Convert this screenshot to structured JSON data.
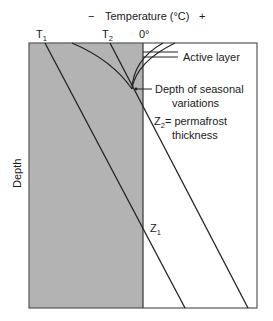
{
  "axis": {
    "title": "Temperature (°C)",
    "minus_sign": "−",
    "plus_sign": "+",
    "ylabel": "Depth"
  },
  "ticks": {
    "t1": {
      "main": "T",
      "sub": "1"
    },
    "t2": {
      "main": "T",
      "sub": "2"
    },
    "zero": "0°"
  },
  "annotations": {
    "active_layer": "Active layer",
    "seasonal_line1": "Depth of seasonal",
    "seasonal_line2": "variations",
    "z2_main": "Z",
    "z2_sub": "2",
    "z2_text": "= permafrost",
    "z2_text2": "thickness",
    "z1_main": "Z",
    "z1_sub": "1"
  },
  "colors": {
    "frozen_fill": "#b3b3b3",
    "line": "#222222",
    "frame": "#555555"
  }
}
